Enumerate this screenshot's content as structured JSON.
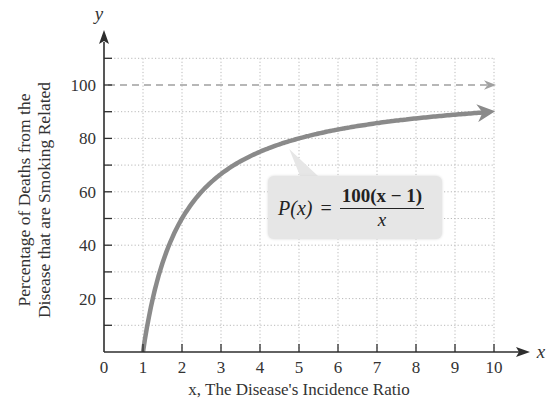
{
  "chart_data": {
    "type": "line",
    "title": "",
    "xlabel": "x, The Disease's Incidence Ratio",
    "xlabel_visible_note": "x-axis caption partially cut off at bottom edge",
    "ylabel": "Percentage of Deaths from the Disease that are Smoking Related",
    "ylabel_lines": [
      "Percentage of Deaths from the",
      "Disease that are Smoking Related"
    ],
    "x_axis_name": "x",
    "y_axis_name": "y",
    "xlim": [
      0,
      10
    ],
    "ylim": [
      0,
      110
    ],
    "x_ticks": [
      0,
      1,
      2,
      3,
      4,
      5,
      6,
      7,
      8,
      9,
      10
    ],
    "y_ticks": [
      20,
      40,
      60,
      80,
      100
    ],
    "y_minor_ticks": [
      10,
      30,
      50,
      70,
      90,
      110
    ],
    "grid": true,
    "grid_style": "dotted",
    "formula": "P(x) = 100(x - 1) / x",
    "formula_parts": {
      "lhs": "P(x)",
      "eq": "=",
      "numerator": "100(x − 1)",
      "denominator": "x"
    },
    "series": [
      {
        "name": "P(x)",
        "style": "solid thick gray with arrow",
        "color": "#8a8a8a",
        "x": [
          1,
          1.5,
          2,
          2.5,
          3,
          3.5,
          4,
          4.5,
          5,
          6,
          7,
          8,
          9,
          10
        ],
        "values": [
          0,
          33.3,
          50,
          60,
          66.7,
          71.4,
          75,
          77.8,
          80,
          83.3,
          85.7,
          87.5,
          88.9,
          90
        ]
      },
      {
        "name": "Horizontal asymptote y = 100",
        "style": "dashed gray with arrow",
        "color": "#9a9a9a",
        "x": [
          0,
          10
        ],
        "values": [
          100,
          100
        ]
      }
    ]
  },
  "labels": {
    "y_axis_name": "y",
    "x_axis_name": "x",
    "ylabel_line1": "Percentage of Deaths from the",
    "ylabel_line2": "Disease that are Smoking Related",
    "xlabel": "x, The Disease's Incidence Ratio",
    "formula_lhs": "P(x)",
    "formula_eq": "=",
    "formula_num": "100(x − 1)",
    "formula_den": "x"
  },
  "colors": {
    "axis": "#2e2e2e",
    "grid": "#b9b9b9",
    "curve": "#8a8a8a",
    "asymptote": "#a0a0a0",
    "formula_box": "#e6e6e6"
  }
}
